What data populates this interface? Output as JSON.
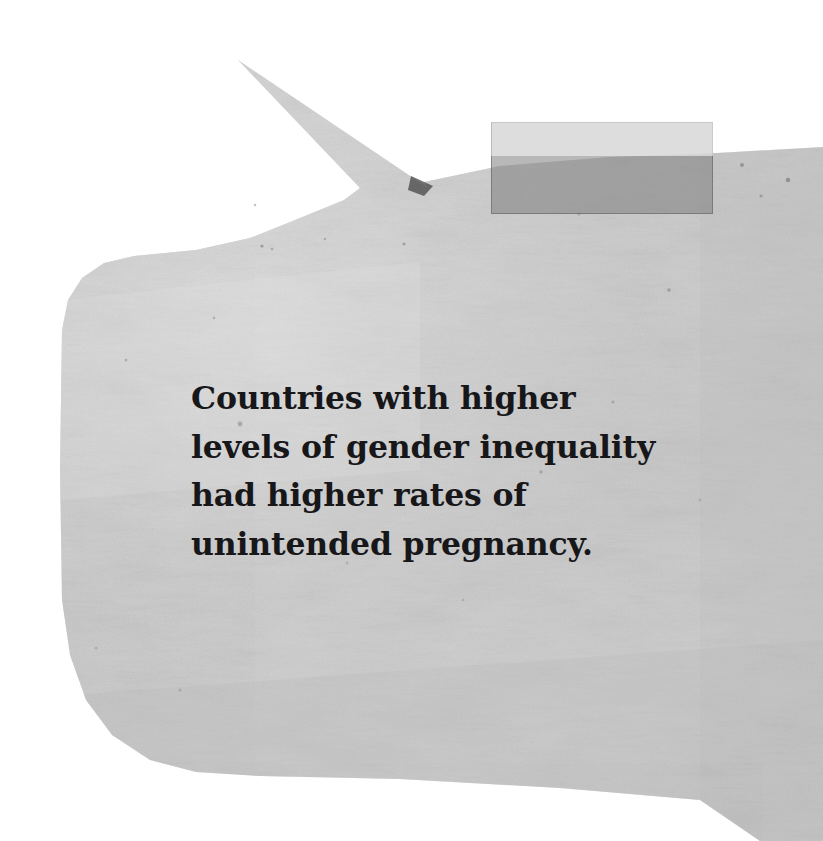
{
  "canvas": {
    "width": 823,
    "height": 841,
    "background_color": "#ffffff"
  },
  "note": {
    "type": "torn-paper-speech-bubble",
    "paper_color": "#c9c9c9",
    "paper_highlight_color": "#dedede",
    "paper_shadow_color": "#b3b3b3",
    "text_color": "#17171a",
    "lines": [
      "Countries with higher",
      "levels of gender inequality",
      "had higher rates of",
      "unintended pregnancy."
    ],
    "full_text": "Countries with higher levels of gender inequality had higher rates of unintended pregnancy."
  },
  "tape": {
    "label": "masking-tape-strip",
    "upper_color": "#d6d6d6",
    "lower_color": "#7e7e7e",
    "x": 491,
    "y": 122,
    "width": 222,
    "height": 92
  },
  "tail": {
    "label": "speech-bubble-tail",
    "apex_x": 238,
    "apex_y": 60
  }
}
